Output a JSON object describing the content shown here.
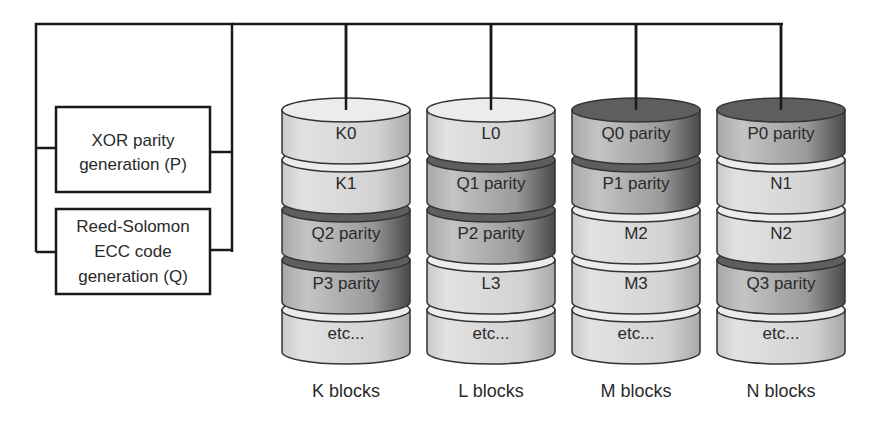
{
  "generators": {
    "xor": {
      "line1": "XOR parity",
      "line2": "generation (P)"
    },
    "rs": {
      "line1": "Reed-Solomon",
      "line2": "ECC code",
      "line3": "generation (Q)"
    }
  },
  "stacks": [
    {
      "label": "K blocks",
      "blocks": [
        "K0",
        "K1",
        "Q2 parity",
        "P3 parity",
        "etc..."
      ]
    },
    {
      "label": "L blocks",
      "blocks": [
        "L0",
        "Q1 parity",
        "P2 parity",
        "L3",
        "etc..."
      ]
    },
    {
      "label": "M blocks",
      "blocks": [
        "Q0 parity",
        "P1 parity",
        "M2",
        "M3",
        "etc..."
      ]
    },
    {
      "label": "N blocks",
      "blocks": [
        "P0 parity",
        "N1",
        "N2",
        "Q3 parity",
        "etc..."
      ]
    }
  ],
  "colors": {
    "data_block": "#d4d4d4",
    "parity_block": "#8a8a8a",
    "line": "#1a1a1a"
  }
}
